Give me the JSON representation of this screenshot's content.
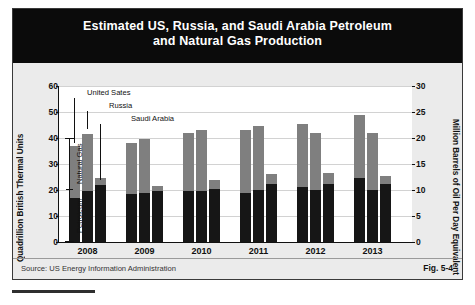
{
  "figure": {
    "title_line1": "Estimated US, Russia, and Saudi Arabia Petroleum",
    "title_line2": "and Natural Gas Production",
    "source_label": "Source:  US Energy Information Administration",
    "figure_number": "Fig. 5-4"
  },
  "axes": {
    "left_title": "Quadrillion British Thermal Units",
    "right_title": "Million Barrels of Oil Per Day Equivalent",
    "left_ticks": [
      "0",
      "10",
      "20",
      "30",
      "40",
      "50",
      "60"
    ],
    "right_ticks": [
      "0",
      "5",
      "10",
      "15",
      "20",
      "25",
      "30"
    ]
  },
  "bracket": {
    "upper_label": "Natural Gas",
    "lower_label": "Petroleum"
  },
  "callouts": [
    {
      "label": "United Sates"
    },
    {
      "label": "Russia"
    },
    {
      "label": "Saudi Arabia"
    }
  ],
  "colors": {
    "petroleum": "#161616",
    "natural_gas": "#7f7f7f",
    "title_band": "#0b0b0b",
    "panel": "#ebebeb",
    "plot_background": "#ffffff",
    "gridline": "#d2d2d2"
  },
  "chart_data": {
    "type": "bar",
    "title": "Estimated US, Russia, and Saudi Arabia Petroleum and Natural Gas Production",
    "subtitle": "",
    "xlabel": "",
    "ylabel": "Quadrillion British Thermal Units",
    "ylabel_secondary": "Million Barrels of Oil Per Day Equivalent",
    "ylim": [
      0,
      60
    ],
    "ylim_secondary": [
      0,
      30
    ],
    "ytick_step": 10,
    "ytick_step_secondary": 5,
    "grid": true,
    "stacked": true,
    "legend": "inline-callouts",
    "legend_position": "inside-top-left",
    "categories": [
      "2008",
      "2009",
      "2010",
      "2011",
      "2012",
      "2013"
    ],
    "groups": [
      "United Sates",
      "Russia",
      "Saudi Arabia"
    ],
    "series": [
      {
        "name": "Petroleum",
        "stack": "bottom",
        "values_by_group": {
          "United Sates": [
            17.0,
            18.5,
            19.5,
            19.0,
            21.0,
            24.5
          ],
          "Russia": [
            19.5,
            19.0,
            19.5,
            20.0,
            20.0,
            20.0
          ],
          "Saudi Arabia": [
            22.0,
            19.5,
            20.5,
            22.5,
            22.5,
            22.5
          ]
        }
      },
      {
        "name": "Natural Gas",
        "stack": "top",
        "values_by_group": {
          "United Sates": [
            20.0,
            19.5,
            22.5,
            24.0,
            24.5,
            24.5
          ],
          "Russia": [
            22.0,
            20.5,
            23.5,
            24.5,
            22.0,
            22.0
          ],
          "Saudi Arabia": [
            2.5,
            2.0,
            3.5,
            3.5,
            4.0,
            3.0
          ]
        }
      }
    ],
    "totals_by_group": {
      "United Sates": [
        37.0,
        38.0,
        42.0,
        43.0,
        45.5,
        49.0
      ],
      "Russia": [
        41.5,
        39.5,
        43.0,
        44.5,
        42.0,
        42.0
      ],
      "Saudi Arabia": [
        24.5,
        21.5,
        24.0,
        26.0,
        26.5,
        25.5
      ]
    },
    "annotations": [
      {
        "text": "Natural Gas",
        "type": "bracket-upper"
      },
      {
        "text": "Petroleum",
        "type": "bracket-lower"
      }
    ],
    "source": "US Energy Information Administration"
  }
}
